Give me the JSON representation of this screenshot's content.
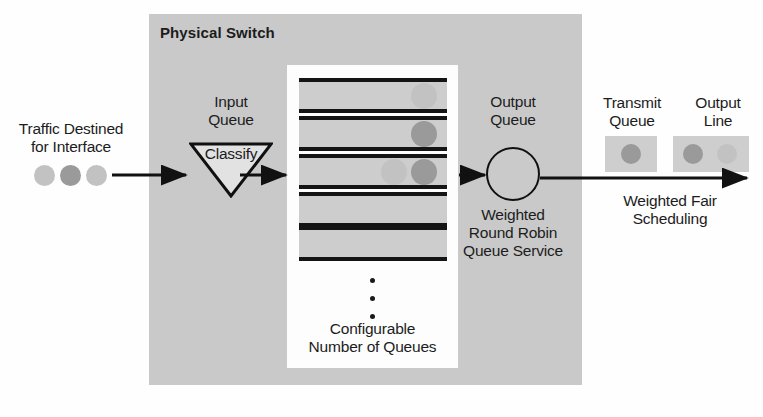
{
  "diagram": {
    "title": "Physical Switch",
    "colors": {
      "switch_fill": "#c9c9c9",
      "queue_box_fill": "#fdfdfd",
      "queue_row_fill": "#cdcdcd",
      "line_black": "#141414",
      "packet_dark": "#9a9a9a",
      "packet_light": "#c2c2c2"
    },
    "labels": {
      "switch": "Physical Switch",
      "traffic_line1": "Traffic Destined",
      "traffic_line2": "for Interface",
      "input_queue_line1": "Input",
      "input_queue_line2": "Queue",
      "classify": "Classify",
      "configurable_line1": "Configurable",
      "configurable_line2": "Number of Queues",
      "output_queue_line1": "Output",
      "output_queue_line2": "Queue",
      "wrr_line1": "Weighted",
      "wrr_line2": "Round Robin",
      "wrr_line3": "Queue Service",
      "transmit_queue_line1": "Transmit",
      "transmit_queue_line2": "Queue",
      "output_line_line1": "Output",
      "output_line_line2": "Line",
      "wfs_line1": "Weighted Fair",
      "wfs_line2": "Scheduling"
    },
    "queues": [
      {
        "packets": [
          {
            "shade": "light"
          }
        ]
      },
      {
        "packets": [
          {
            "shade": "dark"
          }
        ]
      },
      {
        "packets": [
          {
            "shade": "dark"
          },
          {
            "shade": "light"
          }
        ]
      },
      {
        "packets": []
      },
      {
        "packets": []
      }
    ],
    "source_packets": [
      {
        "shade": "light"
      },
      {
        "shade": "dark"
      },
      {
        "shade": "light"
      }
    ],
    "transmit_queue_packets": [
      {
        "shade": "dark"
      }
    ],
    "output_line_packets": [
      {
        "shade": "dark"
      },
      {
        "shade": "light"
      }
    ],
    "ellipsis_count": 3
  }
}
